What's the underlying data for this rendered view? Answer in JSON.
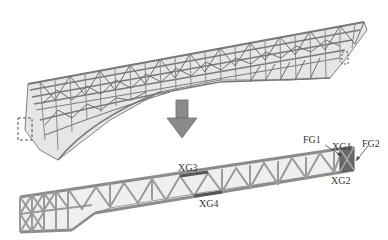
{
  "figure": {
    "top_model": {
      "description": "3D truss model of curved cantilever structure"
    },
    "arrow": {
      "direction": "down",
      "color": "#8a8a8a"
    },
    "bottom_model": {
      "description": "extracted planar truss with labeled members"
    },
    "labels": {
      "fg1": "FG1",
      "xg1": "XG1",
      "fg2": "FG2",
      "xg2": "XG2",
      "xg3": "XG3",
      "xg4": "XG4"
    },
    "colors": {
      "truss": "#7a7a7a",
      "truss_light": "#b5b5b5",
      "highlight": "#555555",
      "background": "#ffffff"
    }
  }
}
